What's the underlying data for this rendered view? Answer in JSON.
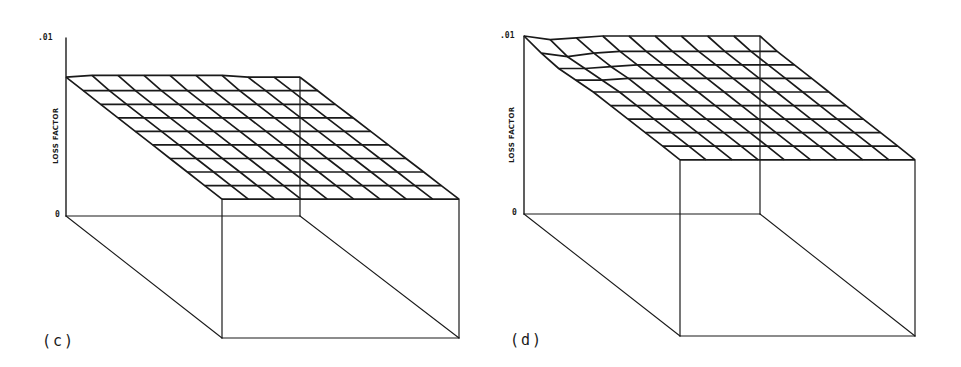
{
  "chart_data": [
    {
      "type": "surface",
      "panel_label": "(c)",
      "title": "",
      "zlabel": "LOSS FACTOR",
      "ztick_labels": [
        ".01",
        "0"
      ],
      "zlim": [
        0,
        0.01
      ],
      "grid": {
        "rows": 9,
        "cols": 9
      },
      "description": "Nearly flat wireframe surface at ~0.0078 loss factor across the whole domain, drawn in an isometric box",
      "surface_values": [
        [
          0.0078,
          0.0079,
          0.0079,
          0.0079,
          0.0079,
          0.0079,
          0.0079,
          0.0078,
          0.0078,
          0.0078
        ],
        [
          0.0078,
          0.0078,
          0.0078,
          0.0078,
          0.0078,
          0.0078,
          0.0078,
          0.0078,
          0.0078,
          0.0078
        ],
        [
          0.0078,
          0.0078,
          0.0078,
          0.0078,
          0.0078,
          0.0078,
          0.0078,
          0.0078,
          0.0078,
          0.0078
        ],
        [
          0.0078,
          0.0078,
          0.0078,
          0.0078,
          0.0078,
          0.0078,
          0.0078,
          0.0078,
          0.0078,
          0.0078
        ],
        [
          0.0078,
          0.0078,
          0.0078,
          0.0078,
          0.0078,
          0.0078,
          0.0078,
          0.0078,
          0.0078,
          0.0078
        ],
        [
          0.0078,
          0.0078,
          0.0078,
          0.0078,
          0.0078,
          0.0078,
          0.0078,
          0.0078,
          0.0078,
          0.0078
        ],
        [
          0.0078,
          0.0078,
          0.0078,
          0.0078,
          0.0078,
          0.0078,
          0.0078,
          0.0078,
          0.0078,
          0.0078
        ],
        [
          0.0078,
          0.0078,
          0.0078,
          0.0078,
          0.0078,
          0.0078,
          0.0078,
          0.0078,
          0.0078,
          0.0078
        ],
        [
          0.0078,
          0.0078,
          0.0078,
          0.0078,
          0.0078,
          0.0078,
          0.0078,
          0.0078,
          0.0078,
          0.0078
        ],
        [
          0.0078,
          0.0078,
          0.0078,
          0.0078,
          0.0078,
          0.0078,
          0.0078,
          0.0078,
          0.0078,
          0.0078
        ]
      ]
    },
    {
      "type": "surface",
      "panel_label": "(d)",
      "title": "",
      "zlabel": "LOSS FACTOR",
      "ztick_labels": [
        ".01",
        "0"
      ],
      "zlim": [
        0,
        0.01
      ],
      "grid": {
        "rows": 9,
        "cols": 9
      },
      "description": "Wireframe surface near ~0.0099 with a ridge/peak reaching 0.01 at the back-left corner and a slight dip just in front of it",
      "surface_values": [
        [
          0.01,
          0.0098,
          0.0099,
          0.01,
          0.01,
          0.01,
          0.01,
          0.01,
          0.01,
          0.01
        ],
        [
          0.0098,
          0.0096,
          0.0098,
          0.0099,
          0.0099,
          0.0099,
          0.0099,
          0.0099,
          0.0099,
          0.0099
        ],
        [
          0.0097,
          0.0097,
          0.0098,
          0.0099,
          0.0099,
          0.0099,
          0.0099,
          0.0099,
          0.0099,
          0.0099
        ],
        [
          0.0098,
          0.0098,
          0.0099,
          0.0099,
          0.0099,
          0.0099,
          0.0099,
          0.0099,
          0.0099,
          0.0099
        ],
        [
          0.0099,
          0.0099,
          0.0099,
          0.0099,
          0.0099,
          0.0099,
          0.0099,
          0.0099,
          0.0099,
          0.0099
        ],
        [
          0.0099,
          0.0099,
          0.0099,
          0.0099,
          0.0099,
          0.0099,
          0.0099,
          0.0099,
          0.0099,
          0.0099
        ],
        [
          0.0099,
          0.0099,
          0.0099,
          0.0099,
          0.0099,
          0.0099,
          0.0099,
          0.0099,
          0.0099,
          0.0099
        ],
        [
          0.0099,
          0.0099,
          0.0099,
          0.0099,
          0.0099,
          0.0099,
          0.0099,
          0.0099,
          0.0099,
          0.0099
        ],
        [
          0.0099,
          0.0099,
          0.0099,
          0.0099,
          0.0099,
          0.0099,
          0.0099,
          0.0099,
          0.0099,
          0.0099
        ],
        [
          0.0099,
          0.0099,
          0.0099,
          0.0099,
          0.0099,
          0.0099,
          0.0099,
          0.0099,
          0.0099,
          0.0099
        ]
      ]
    }
  ],
  "panels": [
    {
      "label": "(c)",
      "ylabel": "LOSS FACTOR",
      "ytick_top": ".01",
      "ytick_bottom": "0",
      "geom": {
        "bl": [
          66,
          216
        ],
        "br": [
          300,
          216
        ],
        "fl": [
          222,
          338
        ],
        "fr": [
          459,
          338
        ],
        "height_px": 178,
        "axis_top": 38
      }
    },
    {
      "label": "(d)",
      "ylabel": "LOSS FACTOR",
      "ytick_top": ".01",
      "ytick_bottom": "0",
      "geom": {
        "bl": [
          524,
          214
        ],
        "br": [
          760,
          214
        ],
        "fl": [
          680,
          336
        ],
        "fr": [
          915,
          336
        ],
        "height_px": 178,
        "axis_top": 36
      }
    }
  ],
  "colors": {
    "ink": "#1a1a1a",
    "background": "#ffffff"
  }
}
